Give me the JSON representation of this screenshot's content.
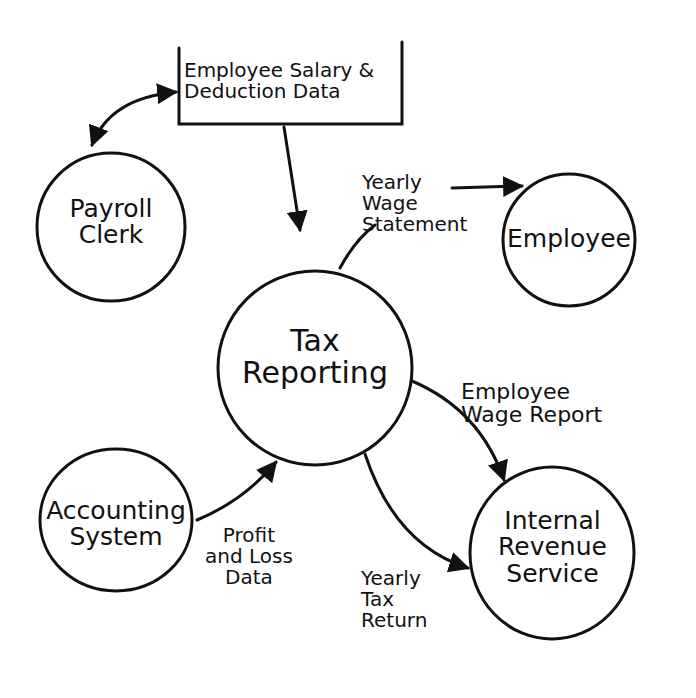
{
  "diagram": {
    "type": "data-flow-diagram",
    "style": "hand-drawn",
    "colors": {
      "ink": "#111111",
      "background": "#ffffff"
    },
    "data_store": {
      "label": "Employee Salary &\nDeduction Data"
    },
    "process": {
      "label": "Tax\nReporting"
    },
    "entities": [
      {
        "id": "payroll_clerk",
        "label": "Payroll\nClerk"
      },
      {
        "id": "employee",
        "label": "Employee"
      },
      {
        "id": "accounting_system",
        "label": "Accounting\nSystem"
      },
      {
        "id": "irs",
        "label": "Internal\nRevenue\nService"
      }
    ],
    "flows": [
      {
        "from": "payroll_clerk",
        "to": "data_store",
        "label": "",
        "bidirectional": true
      },
      {
        "from": "data_store",
        "to": "process",
        "label": ""
      },
      {
        "from": "process",
        "to": "employee",
        "label": "Yearly\nWage\nStatement"
      },
      {
        "from": "process",
        "to": "irs",
        "label": "Employee\nWage Report"
      },
      {
        "from": "process",
        "to": "irs",
        "label": "Yearly\nTax\nReturn"
      },
      {
        "from": "accounting_system",
        "to": "process",
        "label": "Profit\nand Loss\nData"
      }
    ]
  }
}
